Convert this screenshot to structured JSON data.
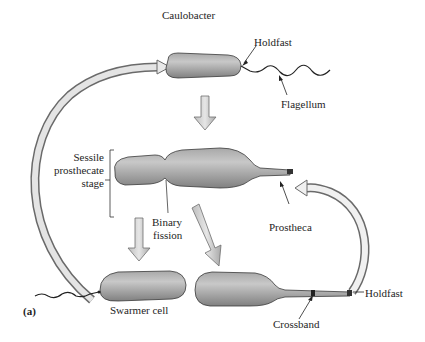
{
  "title": "Caulobacter",
  "panel_label": "(a)",
  "labels": {
    "holdfast_top": "Holdfast",
    "flagellum": "Flagellum",
    "sessile_line1": "Sessile",
    "sessile_line2": "prosthecate",
    "sessile_line3": "stage",
    "binary_line1": "Binary",
    "binary_line2": "fission",
    "prostheca": "Prostheca",
    "swarmer_cell": "Swarmer cell",
    "holdfast_bottom": "Holdfast",
    "crossband": "Crossband"
  },
  "colors": {
    "cell_light": "#c4c4c4",
    "cell_dark": "#7a7a7a",
    "outline": "#3a3a3a",
    "arrow_fill": "#d9d9d9",
    "arrow_stroke": "#6e6e6e"
  }
}
